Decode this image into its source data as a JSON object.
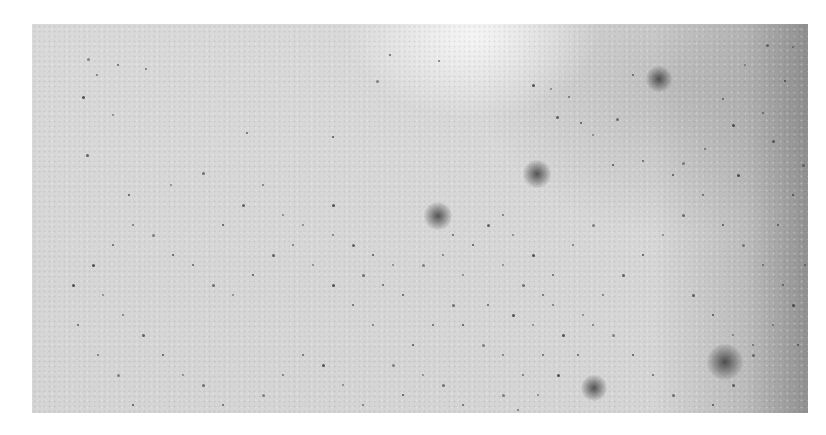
{
  "image": {
    "description": "Grayscale close-up photograph of a light textured surface (skin-like) scattered with many small dark dots and a few larger diffuse dark spots",
    "colors": {
      "background": "#ffffff",
      "surface": "#d9d9d9",
      "dot": "#3a3a3a"
    },
    "blobs": [
      {
        "x": 406,
        "y": 192,
        "r": 14
      },
      {
        "x": 627,
        "y": 55,
        "r": 13
      },
      {
        "x": 693,
        "y": 338,
        "r": 18
      },
      {
        "x": 562,
        "y": 364,
        "r": 13
      },
      {
        "x": 505,
        "y": 150,
        "r": 14
      }
    ],
    "dots": [
      [
        55,
        34
      ],
      [
        64,
        50
      ],
      [
        85,
        40
      ],
      [
        50,
        72
      ],
      [
        80,
        90
      ],
      [
        113,
        44
      ],
      [
        54,
        130
      ],
      [
        96,
        170
      ],
      [
        138,
        160
      ],
      [
        170,
        148
      ],
      [
        214,
        108
      ],
      [
        300,
        112
      ],
      [
        344,
        56
      ],
      [
        406,
        36
      ],
      [
        357,
        30
      ],
      [
        500,
        60
      ],
      [
        518,
        64
      ],
      [
        536,
        72
      ],
      [
        524,
        92
      ],
      [
        548,
        98
      ],
      [
        560,
        110
      ],
      [
        584,
        94
      ],
      [
        610,
        136
      ],
      [
        640,
        150
      ],
      [
        650,
        138
      ],
      [
        672,
        124
      ],
      [
        690,
        74
      ],
      [
        700,
        100
      ],
      [
        712,
        40
      ],
      [
        730,
        88
      ],
      [
        740,
        116
      ],
      [
        752,
        56
      ],
      [
        760,
        22
      ],
      [
        734,
        20
      ],
      [
        600,
        50
      ],
      [
        580,
        140
      ],
      [
        560,
        200
      ],
      [
        540,
        220
      ],
      [
        520,
        250
      ],
      [
        500,
        230
      ],
      [
        480,
        210
      ],
      [
        470,
        190
      ],
      [
        455,
        200
      ],
      [
        440,
        220
      ],
      [
        430,
        250
      ],
      [
        420,
        280
      ],
      [
        400,
        300
      ],
      [
        380,
        320
      ],
      [
        360,
        340
      ],
      [
        340,
        300
      ],
      [
        320,
        280
      ],
      [
        300,
        260
      ],
      [
        280,
        240
      ],
      [
        260,
        220
      ],
      [
        240,
        230
      ],
      [
        220,
        250
      ],
      [
        200,
        270
      ],
      [
        180,
        260
      ],
      [
        160,
        240
      ],
      [
        140,
        230
      ],
      [
        120,
        210
      ],
      [
        100,
        200
      ],
      [
        80,
        220
      ],
      [
        60,
        240
      ],
      [
        70,
        270
      ],
      [
        90,
        290
      ],
      [
        110,
        310
      ],
      [
        130,
        330
      ],
      [
        150,
        350
      ],
      [
        170,
        360
      ],
      [
        190,
        380
      ],
      [
        210,
        390
      ],
      [
        230,
        370
      ],
      [
        250,
        350
      ],
      [
        270,
        330
      ],
      [
        290,
        340
      ],
      [
        310,
        360
      ],
      [
        330,
        380
      ],
      [
        350,
        390
      ],
      [
        370,
        370
      ],
      [
        390,
        350
      ],
      [
        410,
        360
      ],
      [
        430,
        380
      ],
      [
        450,
        390
      ],
      [
        470,
        370
      ],
      [
        490,
        350
      ],
      [
        510,
        330
      ],
      [
        530,
        310
      ],
      [
        550,
        290
      ],
      [
        570,
        270
      ],
      [
        590,
        250
      ],
      [
        610,
        230
      ],
      [
        630,
        210
      ],
      [
        650,
        190
      ],
      [
        670,
        170
      ],
      [
        690,
        200
      ],
      [
        710,
        220
      ],
      [
        730,
        240
      ],
      [
        750,
        260
      ],
      [
        760,
        280
      ],
      [
        740,
        300
      ],
      [
        720,
        320
      ],
      [
        700,
        360
      ],
      [
        680,
        380
      ],
      [
        660,
        390
      ],
      [
        640,
        370
      ],
      [
        620,
        350
      ],
      [
        600,
        330
      ],
      [
        580,
        310
      ],
      [
        560,
        300
      ],
      [
        545,
        330
      ],
      [
        525,
        350
      ],
      [
        505,
        370
      ],
      [
        485,
        385
      ],
      [
        465,
        400
      ],
      [
        380,
        395
      ],
      [
        280,
        395
      ],
      [
        200,
        400
      ],
      [
        140,
        400
      ],
      [
        100,
        380
      ],
      [
        85,
        350
      ],
      [
        65,
        330
      ],
      [
        45,
        300
      ],
      [
        40,
        260
      ],
      [
        270,
        200
      ],
      [
        300,
        210
      ],
      [
        320,
        220
      ],
      [
        340,
        230
      ],
      [
        360,
        240
      ],
      [
        330,
        250
      ],
      [
        350,
        260
      ],
      [
        370,
        270
      ],
      [
        390,
        240
      ],
      [
        410,
        230
      ],
      [
        420,
        210
      ],
      [
        300,
        180
      ],
      [
        250,
        190
      ],
      [
        230,
        160
      ],
      [
        210,
        180
      ],
      [
        190,
        200
      ],
      [
        470,
        240
      ],
      [
        490,
        260
      ],
      [
        510,
        270
      ],
      [
        430,
        300
      ],
      [
        450,
        320
      ],
      [
        470,
        330
      ],
      [
        455,
        280
      ],
      [
        480,
        290
      ],
      [
        500,
        300
      ],
      [
        520,
        280
      ],
      [
        660,
        270
      ],
      [
        680,
        290
      ],
      [
        700,
        310
      ],
      [
        720,
        330
      ],
      [
        745,
        200
      ],
      [
        760,
        170
      ],
      [
        770,
        140
      ],
      [
        772,
        240
      ],
      [
        765,
        320
      ],
      [
        705,
        150
      ]
    ]
  }
}
